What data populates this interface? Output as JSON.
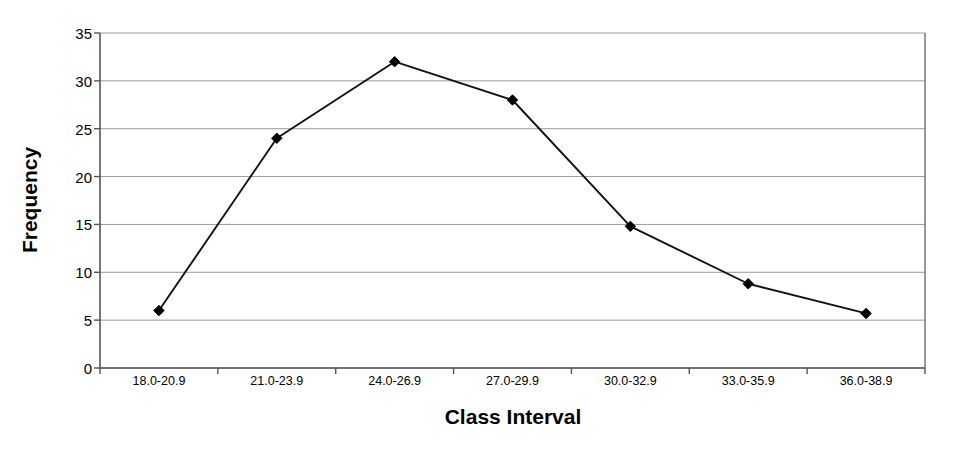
{
  "chart_data": {
    "type": "line",
    "title": "",
    "xlabel": "Class Interval",
    "ylabel": "Frequency",
    "categories": [
      "18.0-20.9",
      "21.0-23.9",
      "24.0-26.9",
      "27.0-29.9",
      "30.0-32.9",
      "33.0-35.9",
      "36.0-38.9"
    ],
    "values": [
      6,
      24,
      32,
      28,
      14.8,
      8.8,
      5.7
    ],
    "ylim": [
      0,
      35
    ],
    "yticks": [
      0,
      5,
      10,
      15,
      20,
      25,
      30,
      35
    ],
    "ytick_labels": [
      "0",
      "5",
      "10",
      "15",
      "20",
      "25",
      "30",
      "35"
    ],
    "grid": true,
    "grid_axis": "y",
    "legend": false,
    "marker": "diamond",
    "series": [
      {
        "name": "Frequency",
        "values": [
          6,
          24,
          32,
          28,
          14.8,
          8.8,
          5.7
        ]
      }
    ]
  },
  "style": {
    "line_color": "#111111",
    "marker_color": "#000000",
    "grid_color": "#9a9a9a",
    "axis_color": "#555555",
    "background": "#ffffff",
    "text_color": "#000000"
  }
}
